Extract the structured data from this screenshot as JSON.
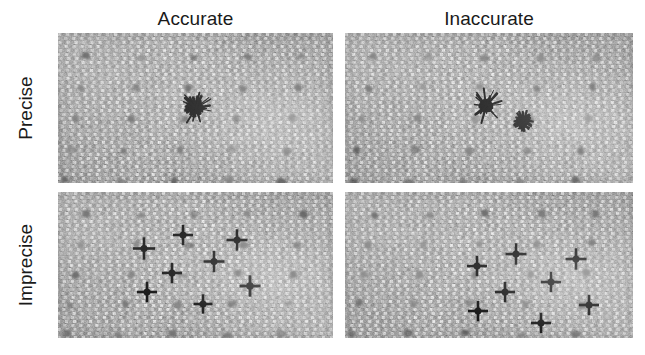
{
  "figure": {
    "width": 645,
    "height": 355,
    "background_color": "#ffffff",
    "mark_color": "#101010",
    "panel_base_color": "#ababab",
    "peg_dot_color": "#6d6d6d"
  },
  "columns": [
    {
      "key": "accurate",
      "label": "Accurate"
    },
    {
      "key": "inaccurate",
      "label": "Inaccurate"
    }
  ],
  "rows": [
    {
      "key": "precise",
      "label": "Precise"
    },
    {
      "key": "imprecise",
      "label": "Imprecise"
    }
  ],
  "panels": [
    {
      "key": "accurate-precise",
      "column": "Accurate",
      "row": "Precise",
      "x": 58,
      "y": 33,
      "width": 275,
      "height": 150,
      "bullseye": {
        "x": 137,
        "y": 74
      },
      "cluster_style": "tight-overlapping-burst",
      "peg_grid": {
        "cols": 5,
        "rows": 5,
        "x0": 28,
        "y0": 24,
        "dx": 54,
        "dy": 31,
        "skew_x": -5,
        "radius": 4.0,
        "extra_small": [
          {
            "x": 10,
            "y": 128,
            "r": 2.2
          },
          {
            "x": 136,
            "y": 128,
            "r": 2.4
          },
          {
            "x": 262,
            "y": 126,
            "r": 2.2
          }
        ]
      },
      "marks": [
        {
          "x": 136.0,
          "y": 73.5,
          "len": 17,
          "th": 2.4,
          "rot": 0
        },
        {
          "x": 137.5,
          "y": 72.0,
          "len": 19,
          "th": 2.2,
          "rot": 12
        },
        {
          "x": 135.0,
          "y": 75.5,
          "len": 18,
          "th": 2.6,
          "rot": -14
        },
        {
          "x": 138.0,
          "y": 75.0,
          "len": 16,
          "th": 2.2,
          "rot": 28
        },
        {
          "x": 134.5,
          "y": 72.5,
          "len": 17,
          "th": 2.4,
          "rot": -30
        },
        {
          "x": 137.0,
          "y": 76.5,
          "len": 15,
          "th": 2.0,
          "rot": 45
        },
        {
          "x": 135.5,
          "y": 70.5,
          "len": 16,
          "th": 2.2,
          "rot": 60
        },
        {
          "x": 138.5,
          "y": 73.0,
          "len": 15,
          "th": 2.0,
          "rot": -50
        },
        {
          "x": 133.5,
          "y": 74.5,
          "len": 14,
          "th": 2.2,
          "rot": 8
        },
        {
          "x": 136.5,
          "y": 71.0,
          "len": 15,
          "th": 2.0,
          "rot": -8
        },
        {
          "x": 137.0,
          "y": 78.0,
          "len": 13,
          "th": 2.0,
          "rot": 20
        },
        {
          "x": 134.0,
          "y": 77.0,
          "len": 13,
          "th": 1.8,
          "rot": -22
        }
      ]
    },
    {
      "key": "inaccurate-precise",
      "column": "Inaccurate",
      "row": "Precise",
      "x": 345,
      "y": 33,
      "width": 288,
      "height": 150,
      "bullseye": {
        "x": 140,
        "y": 72
      },
      "cluster_style": "tight-overlapping-burst-offset",
      "peg_grid": {
        "cols": 5,
        "rows": 5,
        "x0": 28,
        "y0": 24,
        "dx": 56,
        "dy": 31,
        "skew_x": -5,
        "radius": 4.0,
        "extra_small": [
          {
            "x": 10,
            "y": 128,
            "r": 2.2
          },
          {
            "x": 140,
            "y": 128,
            "r": 2.4
          },
          {
            "x": 272,
            "y": 126,
            "r": 2.2
          }
        ]
      },
      "marks": [
        {
          "x": 178.0,
          "y": 88.0,
          "len": 17,
          "th": 2.4,
          "rot": 0
        },
        {
          "x": 179.5,
          "y": 86.5,
          "len": 19,
          "th": 2.2,
          "rot": 14
        },
        {
          "x": 177.0,
          "y": 90.0,
          "len": 18,
          "th": 2.6,
          "rot": -16
        },
        {
          "x": 180.0,
          "y": 89.5,
          "len": 16,
          "th": 2.2,
          "rot": 30
        },
        {
          "x": 176.5,
          "y": 87.0,
          "len": 17,
          "th": 2.4,
          "rot": -32
        },
        {
          "x": 179.0,
          "y": 91.0,
          "len": 15,
          "th": 2.0,
          "rot": 48
        },
        {
          "x": 177.5,
          "y": 85.0,
          "len": 16,
          "th": 2.2,
          "rot": 62
        },
        {
          "x": 180.5,
          "y": 87.5,
          "len": 15,
          "th": 2.0,
          "rot": -52
        },
        {
          "x": 175.5,
          "y": 89.0,
          "len": 14,
          "th": 2.2,
          "rot": 6
        },
        {
          "x": 178.5,
          "y": 85.5,
          "len": 15,
          "th": 2.0,
          "rot": -6
        },
        {
          "x": 179.0,
          "y": 92.5,
          "len": 13,
          "th": 2.0,
          "rot": 22
        },
        {
          "x": 176.0,
          "y": 91.5,
          "len": 13,
          "th": 1.8,
          "rot": -24
        }
      ]
    },
    {
      "key": "accurate-imprecise",
      "column": "Accurate",
      "row": "Imprecise",
      "x": 58,
      "y": 192,
      "width": 275,
      "height": 146,
      "bullseye": {
        "x": 137,
        "y": 71
      },
      "cluster_style": "scattered-around-center",
      "peg_grid": {
        "cols": 5,
        "rows": 5,
        "x0": 28,
        "y0": 22,
        "dx": 54,
        "dy": 30,
        "skew_x": -5,
        "radius": 4.0,
        "extra_small": [
          {
            "x": 10,
            "y": 126,
            "r": 2.2
          },
          {
            "x": 133,
            "y": 126,
            "r": 2.6
          },
          {
            "x": 250,
            "y": 124,
            "r": 2.2
          }
        ]
      },
      "marks": [
        {
          "x": 86.0,
          "y": 56.5,
          "len": 22,
          "th": 2.6,
          "rot": 0
        },
        {
          "x": 125.0,
          "y": 43.0,
          "len": 20,
          "th": 2.6,
          "rot": 0
        },
        {
          "x": 179.0,
          "y": 48.0,
          "len": 21,
          "th": 2.6,
          "rot": 0
        },
        {
          "x": 156.0,
          "y": 69.5,
          "len": 21,
          "th": 2.6,
          "rot": 0
        },
        {
          "x": 114.0,
          "y": 81.0,
          "len": 20,
          "th": 2.6,
          "rot": 0
        },
        {
          "x": 192.0,
          "y": 94.0,
          "len": 21,
          "th": 2.8,
          "rot": 0
        },
        {
          "x": 89.0,
          "y": 100.0,
          "len": 20,
          "th": 2.6,
          "rot": 0
        },
        {
          "x": 145.0,
          "y": 112.0,
          "len": 19,
          "th": 2.6,
          "rot": 0
        }
      ]
    },
    {
      "key": "inaccurate-imprecise",
      "column": "Inaccurate",
      "row": "Imprecise",
      "x": 345,
      "y": 192,
      "width": 288,
      "height": 146,
      "bullseye": {
        "x": 140,
        "y": 71
      },
      "cluster_style": "scattered-offset-right",
      "peg_grid": {
        "cols": 5,
        "rows": 5,
        "x0": 28,
        "y0": 22,
        "dx": 56,
        "dy": 30,
        "skew_x": -5,
        "radius": 4.0,
        "extra_small": [
          {
            "x": 10,
            "y": 126,
            "r": 2.2
          },
          {
            "x": 140,
            "y": 126,
            "r": 2.6
          },
          {
            "x": 262,
            "y": 124,
            "r": 2.2
          }
        ]
      },
      "marks": [
        {
          "x": 171.0,
          "y": 62.0,
          "len": 21,
          "th": 2.6,
          "rot": 0
        },
        {
          "x": 132.0,
          "y": 74.0,
          "len": 20,
          "th": 2.6,
          "rot": 0
        },
        {
          "x": 231.0,
          "y": 67.0,
          "len": 21,
          "th": 2.6,
          "rot": 0
        },
        {
          "x": 206.0,
          "y": 90.0,
          "len": 20,
          "th": 2.6,
          "rot": 0
        },
        {
          "x": 160.0,
          "y": 100.0,
          "len": 20,
          "th": 2.6,
          "rot": 0
        },
        {
          "x": 133.0,
          "y": 119.0,
          "len": 20,
          "th": 2.6,
          "rot": 0
        },
        {
          "x": 244.0,
          "y": 113.0,
          "len": 20,
          "th": 2.6,
          "rot": 0
        },
        {
          "x": 196.0,
          "y": 131.0,
          "len": 20,
          "th": 2.6,
          "rot": 0
        }
      ]
    }
  ]
}
